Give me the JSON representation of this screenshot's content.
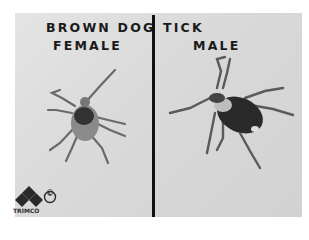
{
  "image": {
    "description": "Black and white photograph comparing female and male brown dog ticks",
    "title_line_left": "BROWN DOG",
    "title_line_right": "TICK",
    "left_label": "FEMALE",
    "right_label": "MALE",
    "logo_text": "TRIMCO",
    "copyright_symbol": "©",
    "colors": {
      "background": "#d9d9d9",
      "divider": "#111111",
      "text": "#1a1a1a"
    }
  }
}
